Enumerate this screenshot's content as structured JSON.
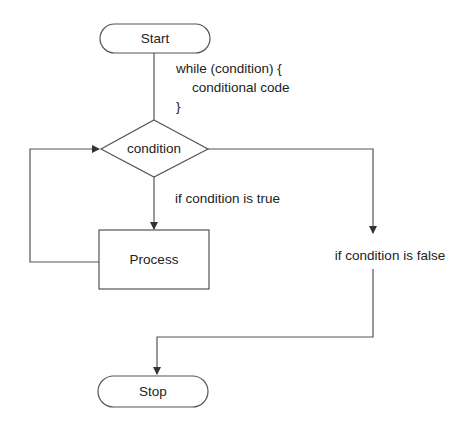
{
  "diagram": {
    "nodes": {
      "start": {
        "label": "Start",
        "shape": "terminator"
      },
      "condition": {
        "label": "condition",
        "shape": "decision"
      },
      "process": {
        "label": "Process",
        "shape": "process"
      },
      "stop": {
        "label": "Stop",
        "shape": "terminator"
      }
    },
    "code": {
      "line1": "while (condition) {",
      "line2": "conditional code",
      "line3": "}"
    },
    "edges": {
      "true_label": "if condition is true",
      "false_label": "if condition is false"
    },
    "colors": {
      "stroke": "#555555",
      "text": "#222222",
      "background": "#ffffff"
    }
  }
}
